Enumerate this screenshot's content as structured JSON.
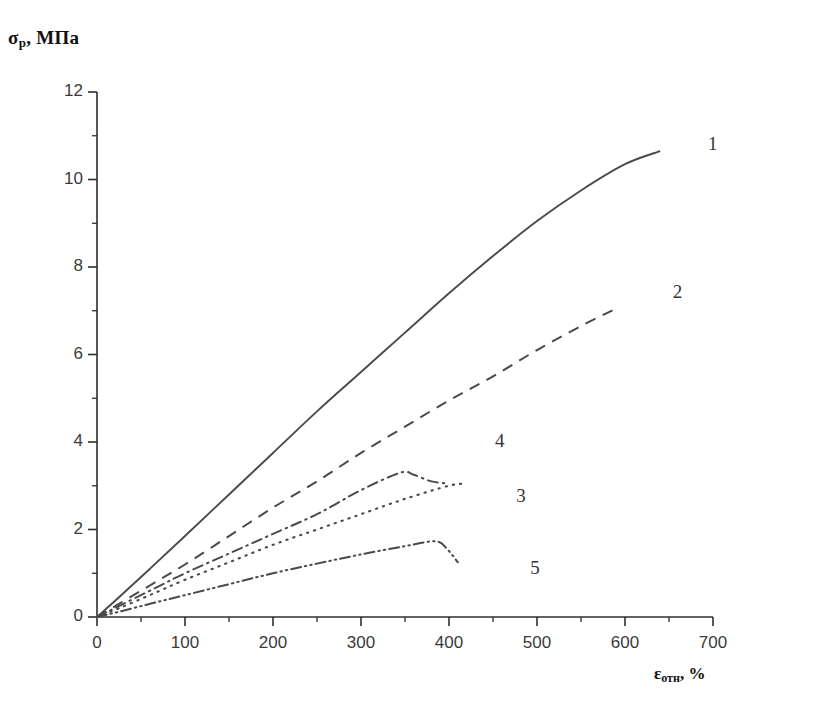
{
  "chart_data": {
    "type": "line",
    "title": "",
    "xlabel": "εотн, %",
    "xlabel_main": "ε",
    "xlabel_sub": "отн",
    "xlabel_unit": ", %",
    "ylabel": "σp, МПа",
    "ylabel_main": "σ",
    "ylabel_sub": "p",
    "ylabel_unit": ", МПа",
    "xlim": [
      0,
      700
    ],
    "ylim": [
      0,
      12
    ],
    "x_major_ticks": [
      0,
      100,
      200,
      300,
      400,
      500,
      600,
      700
    ],
    "x_minor_step": 50,
    "y_major_ticks": [
      0,
      2,
      4,
      6,
      8,
      10,
      12
    ],
    "y_minor_step": 1,
    "x_tick_labels": [
      "0",
      "100",
      "200",
      "300",
      "400",
      "500",
      "600",
      "700"
    ],
    "y_tick_labels": [
      "0",
      "2",
      "4",
      "6",
      "8",
      "10",
      "12"
    ],
    "grid": false,
    "legend": "inline-numbers",
    "legend_position": "right-of-curves",
    "series": [
      {
        "name": "1",
        "label": "1",
        "style": "solid",
        "color": "#4a4a4a",
        "label_x": 700,
        "label_y": 10.8,
        "x": [
          0,
          25,
          60,
          100,
          150,
          200,
          250,
          300,
          350,
          400,
          450,
          500,
          550,
          600,
          640
        ],
        "y": [
          0,
          0.45,
          1.1,
          1.85,
          2.8,
          3.75,
          4.7,
          5.6,
          6.5,
          7.4,
          8.25,
          9.05,
          9.75,
          10.35,
          10.65
        ]
      },
      {
        "name": "2",
        "label": "2",
        "style": "dashed",
        "color": "#4a4a4a",
        "label_x": 660,
        "label_y": 7.4,
        "x": [
          0,
          25,
          60,
          100,
          150,
          200,
          250,
          300,
          350,
          400,
          450,
          500,
          550,
          590
        ],
        "y": [
          0,
          0.3,
          0.72,
          1.2,
          1.85,
          2.5,
          3.1,
          3.75,
          4.35,
          4.95,
          5.5,
          6.1,
          6.65,
          7.05
        ]
      },
      {
        "name": "3",
        "label": "3",
        "style": "dotted",
        "color": "#4a4a4a",
        "label_x": 482,
        "label_y": 2.75,
        "x": [
          0,
          25,
          60,
          100,
          150,
          200,
          250,
          300,
          350,
          400,
          420
        ],
        "y": [
          0,
          0.2,
          0.5,
          0.85,
          1.25,
          1.65,
          2.0,
          2.35,
          2.7,
          3.0,
          3.05
        ]
      },
      {
        "name": "4",
        "label": "4",
        "style": "dash-dot",
        "color": "#4a4a4a",
        "label_x": 458,
        "label_y": 4.0,
        "x": [
          0,
          25,
          60,
          100,
          150,
          200,
          250,
          300,
          345,
          360,
          380,
          400
        ],
        "y": [
          0,
          0.25,
          0.6,
          1.0,
          1.45,
          1.9,
          2.35,
          2.9,
          3.3,
          3.25,
          3.1,
          3.05
        ]
      },
      {
        "name": "5",
        "label": "5",
        "style": "dash-dot-dot",
        "color": "#4a4a4a",
        "label_x": 498,
        "label_y": 1.1,
        "x": [
          0,
          25,
          60,
          100,
          150,
          200,
          250,
          300,
          350,
          385,
          398,
          410
        ],
        "y": [
          0,
          0.12,
          0.3,
          0.5,
          0.75,
          1.0,
          1.22,
          1.43,
          1.62,
          1.73,
          1.55,
          1.25
        ]
      }
    ]
  }
}
